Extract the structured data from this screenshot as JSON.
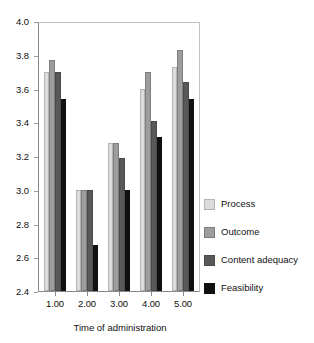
{
  "chart_data": {
    "type": "bar",
    "title": "",
    "xlabel": "Time of administration",
    "ylabel": "",
    "categories": [
      "1.00",
      "2.00",
      "3.00",
      "4.00",
      "5.00"
    ],
    "ylim": [
      2.4,
      4.0
    ],
    "ytick_labels": [
      "2.4",
      "2.6",
      "2.8",
      "3.0",
      "3.2",
      "3.4",
      "3.6",
      "3.8",
      "4.0"
    ],
    "ytick_values": [
      2.4,
      2.6,
      2.8,
      3.0,
      3.2,
      3.4,
      3.6,
      3.8,
      4.0
    ],
    "grid": false,
    "legend_position": "right",
    "series": [
      {
        "name": "Process",
        "color": "#dcdcdc",
        "values": [
          3.7,
          3.0,
          3.28,
          3.6,
          3.73
        ]
      },
      {
        "name": "Outcome",
        "color": "#9d9d9d",
        "values": [
          3.77,
          3.0,
          3.28,
          3.7,
          3.83
        ]
      },
      {
        "name": "Content adequacy",
        "color": "#585858",
        "values": [
          3.7,
          3.0,
          3.19,
          3.41,
          3.64
        ]
      },
      {
        "name": "Feasibility",
        "color": "#101010",
        "values": [
          3.54,
          2.67,
          3.0,
          3.31,
          3.54
        ]
      }
    ]
  }
}
